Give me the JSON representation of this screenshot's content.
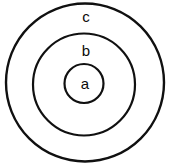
{
  "diagram": {
    "type": "nested-circles",
    "background_color": "#ffffff",
    "stroke_color": "#101010",
    "fill_color": "#ffffff",
    "canvas": {
      "width": 172,
      "height": 168
    },
    "regions": [
      {
        "id": "outer",
        "label": "c",
        "cx": 85,
        "cy": 82.5,
        "r": 79,
        "stroke_width": 2.4,
        "label_x": 86,
        "label_y": 18
      },
      {
        "id": "middle",
        "label": "b",
        "cx": 84,
        "cy": 84.5,
        "r": 51,
        "stroke_width": 2.2,
        "label_x": 86,
        "label_y": 52
      },
      {
        "id": "inner",
        "label": "a",
        "cx": 84,
        "cy": 83.5,
        "r": 19.5,
        "stroke_width": 2.2,
        "label_x": 85,
        "label_y": 85
      }
    ]
  }
}
